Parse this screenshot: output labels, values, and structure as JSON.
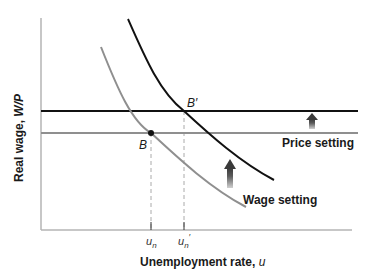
{
  "diagram": {
    "y_axis_label": "Real wage, ",
    "y_axis_label_var": "W/P",
    "x_axis_label": "Unemployment rate, ",
    "x_axis_label_var": "u",
    "tick_un": "u",
    "tick_un_sub": "n",
    "tick_un_prime": "u",
    "tick_un_prime_sub": "n",
    "tick_un_prime_mark": "′",
    "point_b": "B",
    "point_b_prime": "B′",
    "price_setting_label": "Price setting",
    "wage_setting_label": "Wage setting",
    "colors": {
      "black_curve": "#111111",
      "gray_curve": "#8f8f8f",
      "axis": "#b5b5b5",
      "dashed": "#aaaaaa",
      "arrow": "#6e6e6e"
    }
  }
}
